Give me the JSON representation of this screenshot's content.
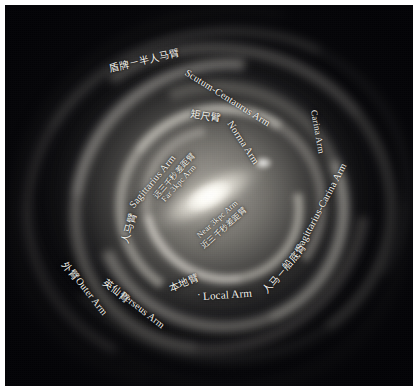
{
  "figure": {
    "type": "annotated-astronomical-illustration",
    "background_color": "#07070a",
    "border_color": "#ffffff",
    "label_color": "#f4f2ec"
  },
  "labels": [
    {
      "id": "scutum-centaurus-arm",
      "zh": "盾牌－半人马臂",
      "en": "Scutum-Centaurus Arm",
      "full": "盾牌－半人马臂 Scutum-Centaurus Arm",
      "position": "top, curving from upper-left toward right along outer arm"
    },
    {
      "id": "norma-arm",
      "zh": "矩尺臂",
      "en": "Norma Arm",
      "full": "矩尺臂 Norma Arm",
      "position": "upper-center, curving down to the right"
    },
    {
      "id": "sagittarius-arm",
      "zh": "人马臂",
      "en": "Sagittarius Arm",
      "full": "人马臂 Sagittarius Arm",
      "position": "left-center, curving upward"
    },
    {
      "id": "far-3kpc-arm",
      "zh": "远三千秒差距臂",
      "en": "Far 3kpc Arm",
      "full": "远三千秒差距臂 Far 3kpc Arm",
      "position": "inner-left, adjacent to the central bar"
    },
    {
      "id": "near-3kpc-arm",
      "zh": "近三千秒差距臂",
      "en": "Near 3kpc Arm",
      "full": "Near 3kpc Arm 近三千秒差距臂",
      "position": "inner-center-right, below the bar"
    },
    {
      "id": "sagittarius-carina-arm",
      "zh": "人马－船底臂",
      "en": "Sagittarius-Carina Arm",
      "full": "人马－船底臂 Sagittarius-Carina Arm",
      "position": "right side, running from lower-left up to upper-right"
    },
    {
      "id": "carina-arm",
      "zh": "",
      "en": "Carina Arm",
      "full": "Carina Arm",
      "position": "upper-right, vertical along outer arm"
    },
    {
      "id": "local-arm",
      "zh": "本地臂",
      "en": "Local Arm",
      "full": "本地臂 · Local Arm",
      "position": "bottom-center"
    },
    {
      "id": "perseus-arm",
      "zh": "英仙臂",
      "en": "Perseus Arm",
      "full": "英仙臂 Perseus Arm",
      "position": "lower-left, angled down-right"
    },
    {
      "id": "outer-arm",
      "zh": "外臂",
      "en": "Outer Arm",
      "full": "外臂 Outer Arm",
      "position": "far lower-left, angled down-right"
    }
  ]
}
